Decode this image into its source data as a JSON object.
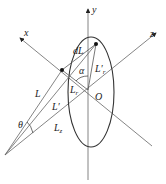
{
  "diagram": {
    "axes": {
      "x": "x",
      "y": "y",
      "z": "z"
    },
    "origin_label": "O",
    "labels": {
      "dL": "dL",
      "alpha": "α",
      "Lr_prime": "L′",
      "Lr_prime_sub": "r",
      "Lr": "L",
      "Lr_sub": "r",
      "L": "L",
      "L_prime": "L′",
      "theta": "θ",
      "Lz": "L",
      "Lz_sub": "z"
    },
    "colors": {
      "line": "#555555",
      "ellipse": "#333333",
      "arrow": "#111111"
    }
  }
}
